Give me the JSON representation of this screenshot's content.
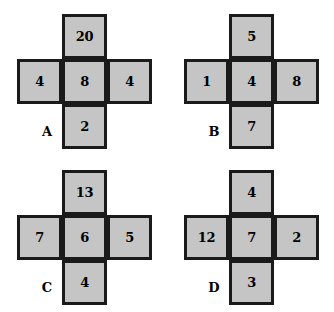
{
  "page": {
    "background_color": "#ffffff",
    "cell_fill_color": "#c5c5c5",
    "cell_border_color": "#1a1a1a",
    "text_color": "#000000"
  },
  "figures": [
    {
      "label": "A",
      "top": "20",
      "left": "4",
      "center": "8",
      "right": "4",
      "bottom": "2"
    },
    {
      "label": "B",
      "top": "5",
      "left": "1",
      "center": "4",
      "right": "8",
      "bottom": "7"
    },
    {
      "label": "C",
      "top": "13",
      "left": "7",
      "center": "6",
      "right": "5",
      "bottom": "4"
    },
    {
      "label": "D",
      "top": "4",
      "left": "12",
      "center": "7",
      "right": "2",
      "bottom": "3"
    }
  ]
}
